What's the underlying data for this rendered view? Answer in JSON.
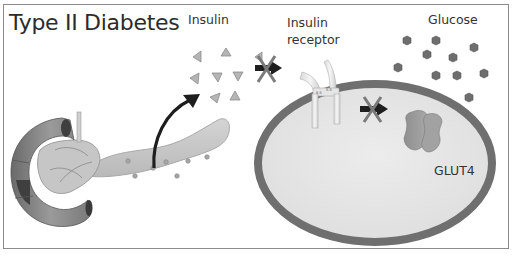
{
  "title": "Type II Diabetes",
  "labels": {
    "insulin": "Insulin",
    "insulin_receptor_line1": "Insulin",
    "insulin_receptor_line2": "receptor",
    "glucose": "Glucose",
    "glut4": "GLUT4",
    "receptor_bond": "S-S"
  },
  "elements": {
    "pancreas": "pancreas-organ",
    "insulin_molecules": 8,
    "glucose_molecules": 11,
    "blocked_steps": 2,
    "cell": "target-cell",
    "transporter": "GLUT4 transporter"
  },
  "colors": {
    "frame": "#8a8a8a",
    "cell_membrane": "#6f6f6f",
    "cell_interior": "#e6e6e6",
    "insulin": "#b5b5b5",
    "glucose": "#6e6e6e",
    "arrow": "#1e1e1e",
    "block_x": "#7a7a7a"
  }
}
